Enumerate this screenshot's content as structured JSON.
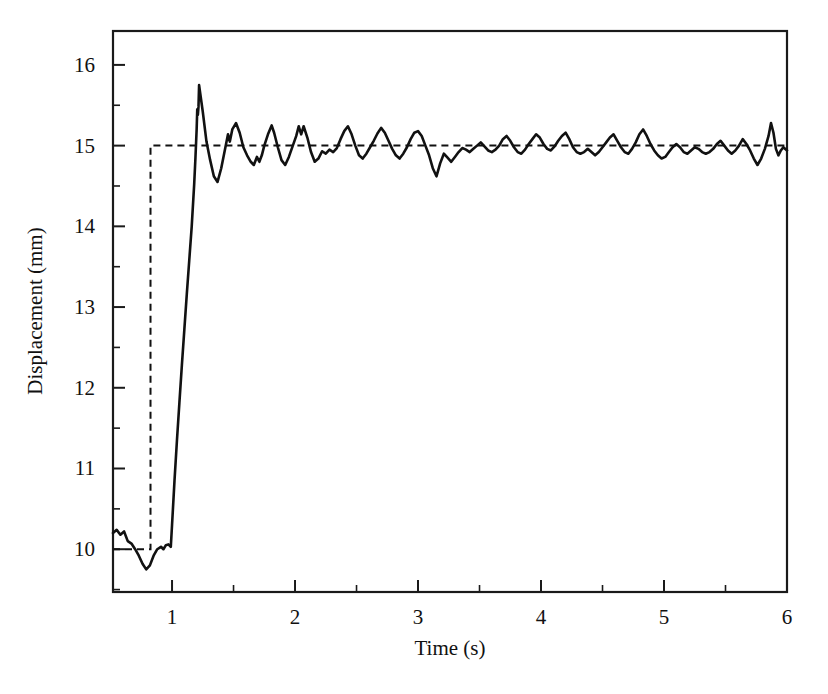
{
  "chart_data": {
    "type": "line",
    "title": "",
    "xlabel": "Time (s)",
    "ylabel": "Displacement (mm)",
    "xlim": [
      0.52,
      6.0
    ],
    "ylim": [
      9.47,
      16.42
    ],
    "grid": false,
    "legend": "none",
    "x_ticks_major": [
      1,
      2,
      3,
      4,
      5,
      6
    ],
    "x_tick_labels": [
      "1",
      "2",
      "3",
      "4",
      "5",
      "6"
    ],
    "x_ticks_minor": [
      1.5,
      2.5,
      3.5,
      4.5,
      5.5
    ],
    "y_ticks_major": [
      10,
      11,
      12,
      13,
      14,
      15,
      16
    ],
    "y_tick_labels": [
      "10",
      "11",
      "12",
      "13",
      "14",
      "15",
      "16"
    ],
    "y_ticks_minor": [
      10.5,
      11.5,
      12.5,
      13.5,
      14.5,
      15.5,
      16.5,
      9.5
    ],
    "series": [
      {
        "name": "reference-step",
        "style": "dashed",
        "color": "#111111",
        "points": [
          [
            0.52,
            10.0
          ],
          [
            0.8,
            10.0
          ],
          [
            0.825,
            10.0
          ],
          [
            0.825,
            15.0
          ],
          [
            0.85,
            15.0
          ],
          [
            6.0,
            15.0
          ]
        ]
      },
      {
        "name": "measured-displacement",
        "style": "solid",
        "color": "#111111",
        "points": [
          [
            0.52,
            10.2
          ],
          [
            0.55,
            10.24
          ],
          [
            0.58,
            10.18
          ],
          [
            0.61,
            10.22
          ],
          [
            0.64,
            10.1
          ],
          [
            0.67,
            10.07
          ],
          [
            0.7,
            10.0
          ],
          [
            0.73,
            9.92
          ],
          [
            0.76,
            9.82
          ],
          [
            0.79,
            9.75
          ],
          [
            0.82,
            9.8
          ],
          [
            0.85,
            9.92
          ],
          [
            0.88,
            10.0
          ],
          [
            0.91,
            10.03
          ],
          [
            0.93,
            10.0
          ],
          [
            0.95,
            10.05
          ],
          [
            0.97,
            10.06
          ],
          [
            0.99,
            10.03
          ],
          [
            1.0,
            10.3
          ],
          [
            1.02,
            10.85
          ],
          [
            1.04,
            11.35
          ],
          [
            1.06,
            11.82
          ],
          [
            1.08,
            12.28
          ],
          [
            1.1,
            12.72
          ],
          [
            1.12,
            13.16
          ],
          [
            1.14,
            13.58
          ],
          [
            1.16,
            14.0
          ],
          [
            1.18,
            14.52
          ],
          [
            1.19,
            14.84
          ],
          [
            1.2,
            15.2
          ],
          [
            1.205,
            15.45
          ],
          [
            1.21,
            15.38
          ],
          [
            1.215,
            15.48
          ],
          [
            1.22,
            15.75
          ],
          [
            1.25,
            15.42
          ],
          [
            1.28,
            15.05
          ],
          [
            1.31,
            14.82
          ],
          [
            1.34,
            14.62
          ],
          [
            1.37,
            14.55
          ],
          [
            1.4,
            14.72
          ],
          [
            1.43,
            14.95
          ],
          [
            1.455,
            15.14
          ],
          [
            1.47,
            15.05
          ],
          [
            1.49,
            15.2
          ],
          [
            1.52,
            15.28
          ],
          [
            1.55,
            15.16
          ],
          [
            1.58,
            14.98
          ],
          [
            1.61,
            14.88
          ],
          [
            1.64,
            14.8
          ],
          [
            1.665,
            14.76
          ],
          [
            1.69,
            14.86
          ],
          [
            1.71,
            14.8
          ],
          [
            1.73,
            14.88
          ],
          [
            1.75,
            15.0
          ],
          [
            1.78,
            15.14
          ],
          [
            1.81,
            15.25
          ],
          [
            1.83,
            15.16
          ],
          [
            1.86,
            14.98
          ],
          [
            1.89,
            14.82
          ],
          [
            1.92,
            14.76
          ],
          [
            1.95,
            14.86
          ],
          [
            1.98,
            14.99
          ],
          [
            2.01,
            15.12
          ],
          [
            2.03,
            15.24
          ],
          [
            2.05,
            15.14
          ],
          [
            2.07,
            15.24
          ],
          [
            2.1,
            15.1
          ],
          [
            2.13,
            14.92
          ],
          [
            2.16,
            14.8
          ],
          [
            2.19,
            14.84
          ],
          [
            2.22,
            14.93
          ],
          [
            2.25,
            14.9
          ],
          [
            2.28,
            14.95
          ],
          [
            2.31,
            14.92
          ],
          [
            2.34,
            14.97
          ],
          [
            2.37,
            15.08
          ],
          [
            2.4,
            15.18
          ],
          [
            2.43,
            15.24
          ],
          [
            2.46,
            15.14
          ],
          [
            2.49,
            15.0
          ],
          [
            2.52,
            14.88
          ],
          [
            2.55,
            14.84
          ],
          [
            2.58,
            14.9
          ],
          [
            2.61,
            14.98
          ],
          [
            2.64,
            15.06
          ],
          [
            2.67,
            15.15
          ],
          [
            2.7,
            15.22
          ],
          [
            2.73,
            15.16
          ],
          [
            2.76,
            15.06
          ],
          [
            2.79,
            14.96
          ],
          [
            2.82,
            14.88
          ],
          [
            2.85,
            14.84
          ],
          [
            2.88,
            14.9
          ],
          [
            2.91,
            14.98
          ],
          [
            2.94,
            15.08
          ],
          [
            2.97,
            15.16
          ],
          [
            3.0,
            15.18
          ],
          [
            3.03,
            15.12
          ],
          [
            3.06,
            15.0
          ],
          [
            3.09,
            14.88
          ],
          [
            3.12,
            14.72
          ],
          [
            3.15,
            14.62
          ],
          [
            3.18,
            14.78
          ],
          [
            3.21,
            14.9
          ],
          [
            3.24,
            14.85
          ],
          [
            3.27,
            14.8
          ],
          [
            3.3,
            14.86
          ],
          [
            3.33,
            14.92
          ],
          [
            3.36,
            14.97
          ],
          [
            3.39,
            14.95
          ],
          [
            3.42,
            14.92
          ],
          [
            3.45,
            14.96
          ],
          [
            3.48,
            15.0
          ],
          [
            3.51,
            15.04
          ],
          [
            3.54,
            14.99
          ],
          [
            3.57,
            14.94
          ],
          [
            3.6,
            14.92
          ],
          [
            3.63,
            14.95
          ],
          [
            3.66,
            15.0
          ],
          [
            3.69,
            15.08
          ],
          [
            3.72,
            15.12
          ],
          [
            3.75,
            15.06
          ],
          [
            3.78,
            14.98
          ],
          [
            3.81,
            14.92
          ],
          [
            3.84,
            14.9
          ],
          [
            3.87,
            14.95
          ],
          [
            3.9,
            15.02
          ],
          [
            3.93,
            15.08
          ],
          [
            3.96,
            15.14
          ],
          [
            3.99,
            15.1
          ],
          [
            4.02,
            15.02
          ],
          [
            4.05,
            14.96
          ],
          [
            4.08,
            14.94
          ],
          [
            4.11,
            14.99
          ],
          [
            4.14,
            15.06
          ],
          [
            4.17,
            15.12
          ],
          [
            4.2,
            15.16
          ],
          [
            4.23,
            15.08
          ],
          [
            4.26,
            14.98
          ],
          [
            4.29,
            14.92
          ],
          [
            4.32,
            14.9
          ],
          [
            4.35,
            14.92
          ],
          [
            4.38,
            14.96
          ],
          [
            4.41,
            14.92
          ],
          [
            4.44,
            14.88
          ],
          [
            4.47,
            14.92
          ],
          [
            4.5,
            14.98
          ],
          [
            4.53,
            15.04
          ],
          [
            4.56,
            15.1
          ],
          [
            4.59,
            15.14
          ],
          [
            4.62,
            15.06
          ],
          [
            4.65,
            14.98
          ],
          [
            4.68,
            14.92
          ],
          [
            4.71,
            14.9
          ],
          [
            4.74,
            14.96
          ],
          [
            4.77,
            15.04
          ],
          [
            4.8,
            15.14
          ],
          [
            4.83,
            15.2
          ],
          [
            4.86,
            15.12
          ],
          [
            4.89,
            15.02
          ],
          [
            4.92,
            14.94
          ],
          [
            4.95,
            14.88
          ],
          [
            4.98,
            14.84
          ],
          [
            5.01,
            14.86
          ],
          [
            5.04,
            14.92
          ],
          [
            5.07,
            14.98
          ],
          [
            5.1,
            15.02
          ],
          [
            5.13,
            14.98
          ],
          [
            5.16,
            14.92
          ],
          [
            5.19,
            14.9
          ],
          [
            5.22,
            14.94
          ],
          [
            5.25,
            14.98
          ],
          [
            5.28,
            14.96
          ],
          [
            5.31,
            14.92
          ],
          [
            5.34,
            14.9
          ],
          [
            5.37,
            14.92
          ],
          [
            5.4,
            14.96
          ],
          [
            5.43,
            15.02
          ],
          [
            5.46,
            15.06
          ],
          [
            5.49,
            15.0
          ],
          [
            5.52,
            14.94
          ],
          [
            5.55,
            14.9
          ],
          [
            5.58,
            14.94
          ],
          [
            5.61,
            15.0
          ],
          [
            5.64,
            15.08
          ],
          [
            5.67,
            15.02
          ],
          [
            5.7,
            14.94
          ],
          [
            5.73,
            14.84
          ],
          [
            5.76,
            14.76
          ],
          [
            5.79,
            14.84
          ],
          [
            5.82,
            14.96
          ],
          [
            5.85,
            15.12
          ],
          [
            5.87,
            15.28
          ],
          [
            5.89,
            15.16
          ],
          [
            5.91,
            14.96
          ],
          [
            5.93,
            14.88
          ],
          [
            5.95,
            14.94
          ],
          [
            5.97,
            14.98
          ],
          [
            6.0,
            14.94
          ]
        ]
      }
    ]
  }
}
